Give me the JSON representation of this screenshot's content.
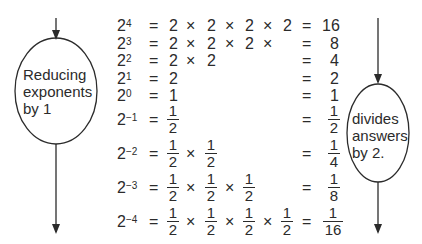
{
  "left_oval": {
    "lines": [
      "Reducing",
      "exponents",
      "by 1"
    ]
  },
  "right_oval": {
    "lines": [
      "divides",
      "answers",
      "by 2."
    ]
  },
  "rows": [
    {
      "base": "2",
      "exp": "4",
      "factors": [
        "2",
        "2",
        "2",
        "2"
      ],
      "result": "16"
    },
    {
      "base": "2",
      "exp": "3",
      "factors": [
        "2",
        "2",
        "2"
      ],
      "trailing_times": true,
      "result": "8"
    },
    {
      "base": "2",
      "exp": "2",
      "factors": [
        "2",
        "2"
      ],
      "result": "4"
    },
    {
      "base": "2",
      "exp": "1",
      "factors": [
        "2"
      ],
      "result": "2"
    },
    {
      "base": "2",
      "exp": "0",
      "factors": [
        "1"
      ],
      "result": "1"
    },
    {
      "base": "2",
      "exp": "−1",
      "fraction_factors": [
        [
          "1",
          "2"
        ]
      ],
      "result_fraction": [
        "1",
        "2"
      ]
    },
    {
      "base": "2",
      "exp": "−2",
      "fraction_factors": [
        [
          "1",
          "2"
        ],
        [
          "1",
          "2"
        ]
      ],
      "result_fraction": [
        "1",
        "4"
      ]
    },
    {
      "base": "2",
      "exp": "−3",
      "fraction_factors": [
        [
          "1",
          "2"
        ],
        [
          "1",
          "2"
        ],
        [
          "1",
          "2"
        ]
      ],
      "result_fraction": [
        "1",
        "8"
      ]
    },
    {
      "base": "2",
      "exp": "−4",
      "fraction_factors": [
        [
          "1",
          "2"
        ],
        [
          "1",
          "2"
        ],
        [
          "1",
          "2"
        ],
        [
          "1",
          "2"
        ]
      ],
      "result_fraction": [
        "1",
        "16"
      ]
    }
  ],
  "symbols": {
    "equals": "=",
    "times": "×"
  },
  "colors": {
    "ink": "#2b2b2b",
    "background": "#ffffff"
  }
}
